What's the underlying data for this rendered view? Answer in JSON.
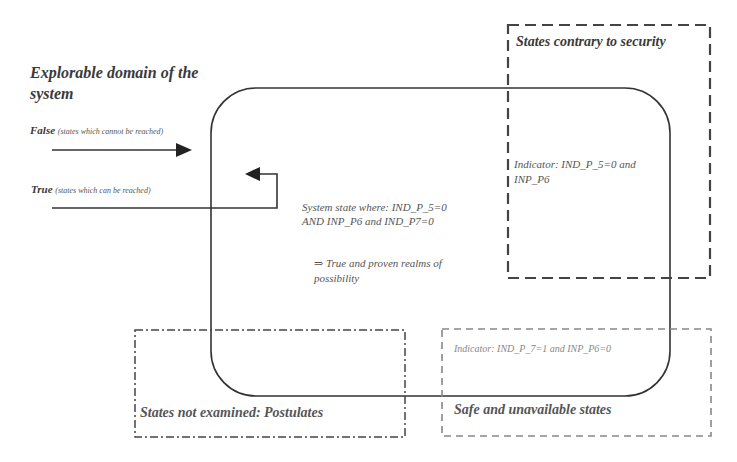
{
  "diagram": {
    "domain_title": {
      "line1": "Explorable domain of the",
      "line2": "system"
    },
    "false_label": {
      "strong": "False",
      "note": "(states which cannot be reached)"
    },
    "true_label": {
      "strong": "True",
      "note": "(states which can be reached)"
    },
    "system_state": {
      "line1": "System state where: IND_P_5=0",
      "line2": "AND INP_P6 and IND_P7=0"
    },
    "realms": {
      "line1": "⇒ True and proven realms of",
      "line2": "possibility"
    },
    "contrary_box": {
      "title": "States contrary to security",
      "indicator_line1": "Indicator: IND_P_5=0 and",
      "indicator_line2": "INP_P6"
    },
    "safe_box": {
      "title": "Safe and unavailable states",
      "indicator": "Indicator: IND_P_7=1 and INP_P6=0"
    },
    "postulates_box": {
      "title": "States not examined: Postulates"
    },
    "colors": {
      "line": "#333333",
      "dashed": "#444444",
      "safe_dashed": "#777777",
      "text": "#3a3a3a"
    }
  }
}
